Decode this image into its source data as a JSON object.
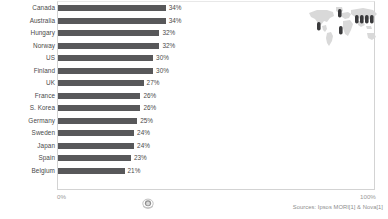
{
  "chart_data": {
    "type": "bar",
    "orientation": "horizontal",
    "title": "",
    "xlabel": "",
    "ylabel": "",
    "xlim": [
      0,
      100
    ],
    "grid": false,
    "legend": null,
    "categories": [
      "Canada",
      "Australia",
      "Hungary",
      "Norway",
      "US",
      "Finland",
      "UK",
      "France",
      "S. Korea",
      "Germany",
      "Sweden",
      "Japan",
      "Spain",
      "Belgium"
    ],
    "values": [
      34,
      34,
      32,
      32,
      30,
      30,
      27,
      26,
      26,
      25,
      24,
      24,
      23,
      21
    ],
    "value_labels": [
      "34%",
      "34%",
      "32%",
      "32%",
      "30%",
      "30%",
      "27%",
      "26%",
      "26%",
      "25%",
      "24%",
      "24%",
      "23%",
      "21%"
    ],
    "axis_ticks": [
      "0%",
      "100%"
    ],
    "bar_color": "#58585a"
  },
  "axis": {
    "min_label": "0%",
    "max_label": "100%"
  },
  "footer": {
    "source": "Sources: Ipsos MORI[1] & Nova[1]"
  },
  "map_inset": {
    "name": "world-map-inset",
    "marker_count": 7,
    "map_fill": "#d8d8d8",
    "marker_fill": "#3a3a3c"
  },
  "watermark": {
    "name": "circular-emblem"
  }
}
